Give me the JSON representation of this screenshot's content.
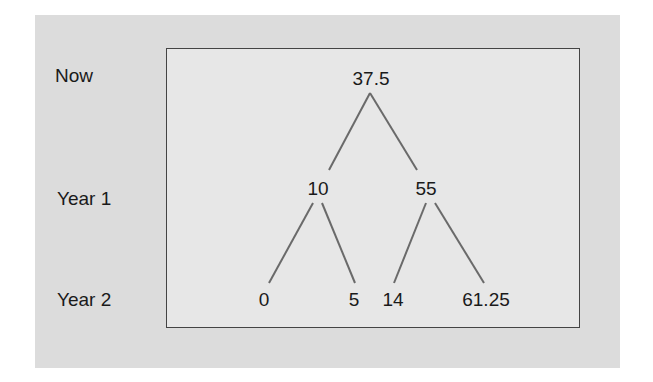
{
  "diagram": {
    "type": "binomial-tree",
    "row_labels": [
      "Now",
      "Year 1",
      "Year 2"
    ],
    "nodes": {
      "root": "37.5",
      "year1": [
        "10",
        "55"
      ],
      "year2": [
        "0",
        "5",
        "14",
        "61.25"
      ]
    },
    "edges": [
      [
        "37.5",
        "10"
      ],
      [
        "37.5",
        "55"
      ],
      [
        "10",
        "0"
      ],
      [
        "10",
        "5"
      ],
      [
        "55",
        "14"
      ],
      [
        "55",
        "61.25"
      ]
    ],
    "colors": {
      "outer_background": "#dcdcdc",
      "inner_background": "#e7e7e7",
      "border": "#444444",
      "edge": "#6a6a6a",
      "text": "#1a1a1a"
    }
  }
}
